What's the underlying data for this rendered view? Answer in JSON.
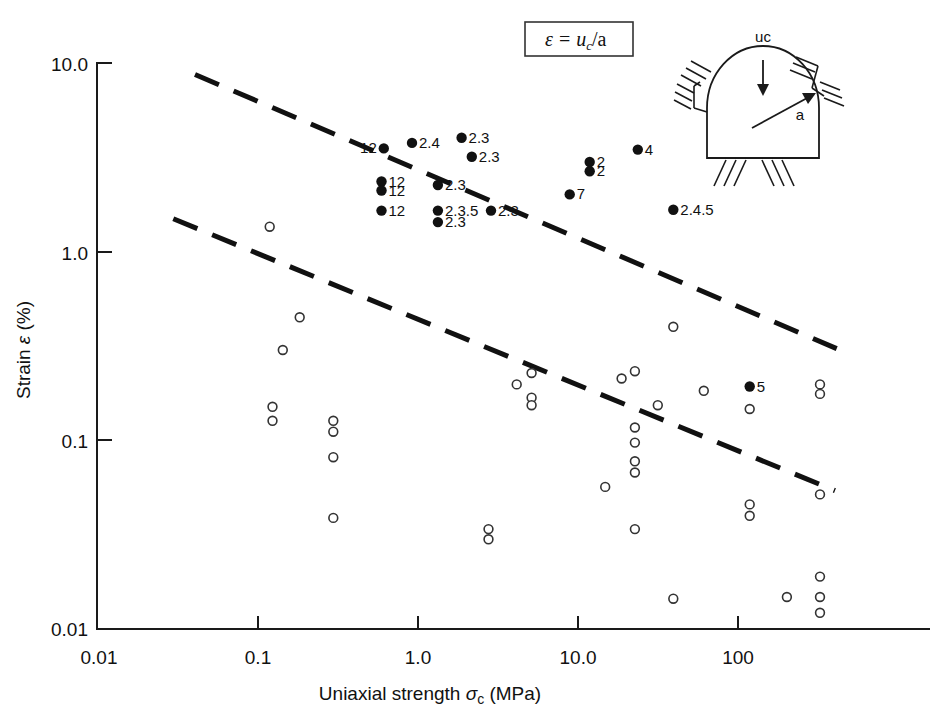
{
  "figure": {
    "background": "#ffffff",
    "ink_color": "#111111"
  },
  "equation_box": {
    "name": "strain-definition",
    "epsilon": "ε",
    "equals": "=",
    "numerator": "u",
    "subscript": "c",
    "denominator": "/a",
    "full_text": "ε = u_c/a"
  },
  "inset": {
    "name": "tunnel-cross-section",
    "load_label": "uc",
    "radius_label": "a"
  },
  "chart_data": {
    "type": "scatter",
    "title": "",
    "xlabel": "Uniaxial strength σc (MPa)",
    "xlabel_parts": {
      "pre": "Uniaxial strength ",
      "sigma": "σ",
      "sub": "c",
      "post": " (MPa)"
    },
    "ylabel": "Strain ε (%)",
    "ylabel_parts": {
      "pre": "Strain ",
      "eps": "ε",
      "post": " (%)"
    },
    "xscale": "log",
    "yscale": "log",
    "xlim": [
      0.01,
      1000
    ],
    "ylim": [
      0.01,
      10
    ],
    "grid": false,
    "legend": "none",
    "xticks": [
      0.01,
      0.1,
      1.0,
      10.0,
      100
    ],
    "xticklabels": [
      "0.01",
      "0.1",
      "1.0",
      "10.0",
      "100"
    ],
    "yticks": [
      0.01,
      0.1,
      1.0,
      10.0
    ],
    "yticklabels": [
      "0.01",
      "0.1",
      "1.0",
      "10.0"
    ],
    "series": [
      {
        "name": "Labelled case histories (filled)",
        "marker": "filled-circle",
        "color": "#111111",
        "points": [
          {
            "x": 0.62,
            "y": 3.6,
            "label": "12",
            "label_side": "left"
          },
          {
            "x": 0.93,
            "y": 3.85,
            "label": "2.4",
            "label_side": "right"
          },
          {
            "x": 1.9,
            "y": 4.1,
            "label": "2.3",
            "label_side": "right"
          },
          {
            "x": 2.2,
            "y": 3.25,
            "label": "2.3",
            "label_side": "right"
          },
          {
            "x": 0.6,
            "y": 2.4,
            "label": "12",
            "label_side": "right"
          },
          {
            "x": 0.6,
            "y": 2.15,
            "label": "12",
            "label_side": "right"
          },
          {
            "x": 0.6,
            "y": 1.68,
            "label": "12",
            "label_side": "right"
          },
          {
            "x": 1.35,
            "y": 2.3,
            "label": "2.3",
            "label_side": "right"
          },
          {
            "x": 1.35,
            "y": 1.68,
            "label": "2.3.5",
            "label_side": "right"
          },
          {
            "x": 1.35,
            "y": 1.46,
            "label": "2.3",
            "label_side": "right"
          },
          {
            "x": 2.9,
            "y": 1.68,
            "label": "2.3",
            "label_side": "right"
          },
          {
            "x": 12.0,
            "y": 3.05,
            "label": "2",
            "label_side": "right"
          },
          {
            "x": 12.0,
            "y": 2.72,
            "label": "2",
            "label_side": "right"
          },
          {
            "x": 9.0,
            "y": 2.05,
            "label": "7",
            "label_side": "right"
          },
          {
            "x": 24.0,
            "y": 3.55,
            "label": "4",
            "label_side": "right"
          },
          {
            "x": 40.0,
            "y": 1.7,
            "label": "2.4.5",
            "label_side": "right"
          },
          {
            "x": 120.0,
            "y": 0.195,
            "label": "5",
            "label_side": "right"
          }
        ]
      },
      {
        "name": "Other case histories (open)",
        "marker": "open-circle",
        "color": "#333333",
        "points": [
          {
            "x": 0.12,
            "y": 1.38
          },
          {
            "x": 0.185,
            "y": 0.455
          },
          {
            "x": 0.145,
            "y": 0.305
          },
          {
            "x": 0.125,
            "y": 0.152
          },
          {
            "x": 0.125,
            "y": 0.128
          },
          {
            "x": 0.3,
            "y": 0.128
          },
          {
            "x": 0.3,
            "y": 0.112
          },
          {
            "x": 0.3,
            "y": 0.082
          },
          {
            "x": 0.3,
            "y": 0.039
          },
          {
            "x": 2.8,
            "y": 0.034
          },
          {
            "x": 2.8,
            "y": 0.03
          },
          {
            "x": 4.2,
            "y": 0.2
          },
          {
            "x": 5.2,
            "y": 0.23
          },
          {
            "x": 5.2,
            "y": 0.17
          },
          {
            "x": 5.2,
            "y": 0.155
          },
          {
            "x": 15.0,
            "y": 0.057
          },
          {
            "x": 19.0,
            "y": 0.215
          },
          {
            "x": 23.0,
            "y": 0.235
          },
          {
            "x": 23.0,
            "y": 0.118
          },
          {
            "x": 23.0,
            "y": 0.098
          },
          {
            "x": 23.0,
            "y": 0.078
          },
          {
            "x": 23.0,
            "y": 0.068
          },
          {
            "x": 23.0,
            "y": 0.034
          },
          {
            "x": 40.0,
            "y": 0.405
          },
          {
            "x": 32.0,
            "y": 0.155
          },
          {
            "x": 40.0,
            "y": 0.0145
          },
          {
            "x": 62.0,
            "y": 0.185
          },
          {
            "x": 120.0,
            "y": 0.148
          },
          {
            "x": 120.0,
            "y": 0.046
          },
          {
            "x": 120.0,
            "y": 0.04
          },
          {
            "x": 205.0,
            "y": 0.0148
          },
          {
            "x": 330.0,
            "y": 0.2
          },
          {
            "x": 330.0,
            "y": 0.178
          },
          {
            "x": 330.0,
            "y": 0.052
          },
          {
            "x": 330.0,
            "y": 0.019
          },
          {
            "x": 330.0,
            "y": 0.0148
          },
          {
            "x": 330.0,
            "y": 0.0122
          }
        ]
      }
    ],
    "trendlines": [
      {
        "name": "upper-bound-dashed",
        "style": "dashed",
        "x0": 0.041,
        "y0": 8.9,
        "x1": 420.0,
        "y1": 0.31
      },
      {
        "name": "lower-bound-dashed",
        "style": "dashed",
        "x0": 0.03,
        "y0": 1.52,
        "x1": 410.0,
        "y1": 0.0545
      }
    ]
  }
}
